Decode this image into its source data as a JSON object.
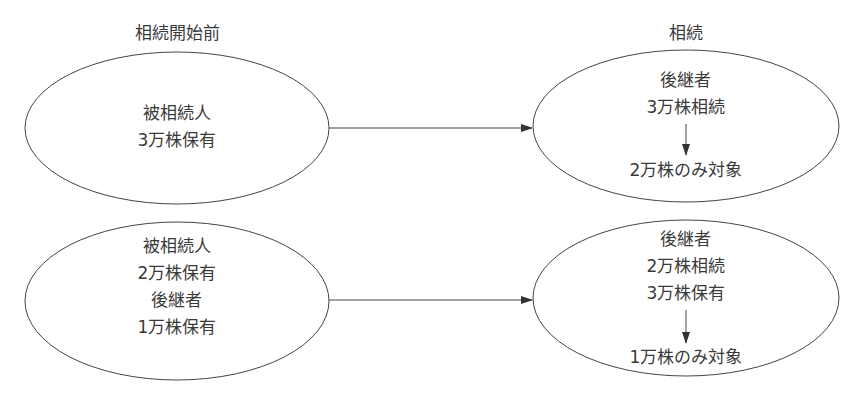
{
  "columns": {
    "before_label": "相続開始前",
    "after_label": "相続"
  },
  "cases": [
    {
      "before": [
        "被相続人",
        "3万株保有"
      ],
      "after_top": [
        "後継者",
        "3万株相続"
      ],
      "after_bottom": "2万株のみ対象"
    },
    {
      "before": [
        "被相続人",
        "2万株保有",
        "後継者",
        "1万株保有"
      ],
      "after_top": [
        "後継者",
        "2万株相続",
        "3万株保有"
      ],
      "after_bottom": "1万株のみ対象"
    }
  ],
  "colors": {
    "stroke": "#333333",
    "text": "#3a3a3a"
  }
}
